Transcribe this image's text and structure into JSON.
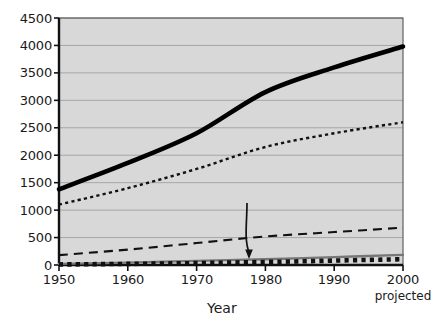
{
  "chart_data": {
    "type": "line",
    "title": "",
    "xlabel": "Year",
    "ylabel": "",
    "x": [
      1950,
      1960,
      1970,
      1980,
      1990,
      2000
    ],
    "xtick_labels": [
      "1950",
      "1960",
      "1970",
      "1980",
      "1990",
      "2000"
    ],
    "xlim": [
      1950,
      2000
    ],
    "ylim": [
      0,
      4500
    ],
    "ytick_labels": [
      "0",
      "500",
      "1000",
      "1500",
      "2000",
      "2500",
      "3000",
      "3500",
      "4000",
      "4500"
    ],
    "ytick_values": [
      0,
      500,
      1000,
      1500,
      2000,
      2500,
      3000,
      3500,
      4000,
      4500
    ],
    "grid": true,
    "legend_position": "inline-right-labels",
    "plot_background": "#d8d8d8",
    "series": [
      {
        "name": "Total",
        "style": "thick-solid-black",
        "color": "#000000",
        "label": "Total",
        "values": [
          1380,
          1860,
          2400,
          3150,
          3600,
          3980
        ]
      },
      {
        "name": "Irrigation",
        "style": "fine-dotted-black",
        "color": "#111111",
        "label": "Irrigation",
        "values": [
          1100,
          1400,
          1750,
          2150,
          2400,
          2600
        ]
      },
      {
        "name": "Industrial",
        "style": "dashed-black",
        "color": "#111111",
        "label": "Industrial",
        "values": [
          180,
          280,
          400,
          520,
          600,
          680
        ]
      },
      {
        "name": "Municipal",
        "style": "thin-solid-gray",
        "color": "#777777",
        "label": "Municipal",
        "values": [
          20,
          45,
          75,
          105,
          145,
          185
        ]
      },
      {
        "name": "Reservoir Evaporation",
        "style": "thick-square-dotted",
        "color": "#111111",
        "label": "Reservoir Evaporation",
        "values": [
          10,
          20,
          35,
          55,
          80,
          105
        ]
      }
    ],
    "annotations": [
      {
        "text": "Reservoir Evaporation",
        "points_to_series": "Reservoir Evaporation",
        "points_to_year": 1980
      },
      {
        "text": "projected",
        "attached_to_xtick": "2000"
      }
    ]
  }
}
